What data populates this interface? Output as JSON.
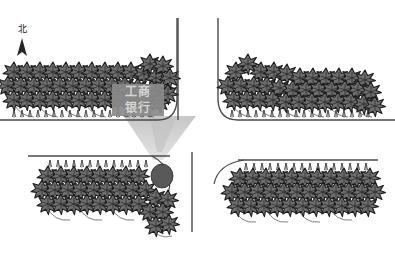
{
  "document": {
    "type": "landscape-planting-plan",
    "title": "工商银行",
    "background_color": "#ffffff"
  },
  "compass": {
    "label": "北",
    "icon": "north-arrow-icon",
    "color": "#1a1a1a",
    "x": 22,
    "y": 32
  },
  "signboard": {
    "line1": "工商",
    "line2": "银行",
    "fill_color": "#8a8a8a",
    "text_color": "#d5d5d5",
    "x": 112,
    "y": 84,
    "width": 52,
    "height": 32
  },
  "palette": {
    "tree_fill": "#6e6e6e",
    "tree_stroke": "#1f1f1f",
    "line_color": "#4a4a4a",
    "shadow_fill": "#cfcfcf",
    "shrub_fill": "#555555",
    "ground_fill": "#bdbdbd"
  },
  "quadrants": [
    {
      "id": "top-left",
      "name": "北西地块",
      "baseline_y": 120,
      "has_signboard": true
    },
    {
      "id": "top-right",
      "name": "北东地块",
      "baseline_y": 120,
      "has_signboard": false
    },
    {
      "id": "bottom-left",
      "name": "南西地块",
      "baseline_y": 156,
      "has_signboard": false
    },
    {
      "id": "bottom-right",
      "name": "南东地块",
      "baseline_y": 160,
      "has_signboard": false
    }
  ],
  "features": {
    "entry_cone": {
      "name": "entrance-plaza-cone",
      "fill": "#d2d2d2"
    },
    "round_shrub": {
      "name": "round-shrub",
      "fill": "#595959",
      "cx": 162,
      "cy": 176,
      "rx": 11,
      "ry": 12
    },
    "road_gap": {
      "name": "central-road",
      "x1": 178,
      "x2": 192
    }
  },
  "tree_rows": {
    "top_left": {
      "rows": 3,
      "cols": 13,
      "start_x": 12,
      "start_y": 68,
      "dx": 13.5,
      "dy": 15
    },
    "top_right": {
      "rows": 3,
      "cols": 13,
      "start_x": 228,
      "start_y": 68,
      "dx": 13.0,
      "dy": 15
    },
    "bottom_left": {
      "rows": 3,
      "cols": 10,
      "start_x": 44,
      "start_y": 172,
      "dx": 13.0,
      "dy": 15
    },
    "bottom_right": {
      "rows": 3,
      "cols": 13,
      "start_x": 228,
      "start_y": 172,
      "dx": 13.0,
      "dy": 15
    }
  }
}
